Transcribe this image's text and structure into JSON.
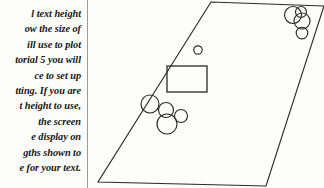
{
  "page": {
    "background_color": "#fdfdfc",
    "ink_color": "#2a2a2a",
    "width": 324,
    "height": 188
  },
  "text_column": {
    "style": "italic",
    "alignment": "right",
    "clipped_at_left_edge": true,
    "lines": [
      "l text height",
      "ow the size of",
      "ill use to plot",
      "torial 5 you will",
      "ce to set up",
      "tting. If you are",
      "t height to use,",
      "the screen",
      "e display on",
      "gths shown to",
      "e for your text."
    ]
  },
  "divider": {
    "orientation": "vertical",
    "color": "#9a9a9a",
    "x": 87
  },
  "diagram": {
    "caption": "",
    "outline": {
      "name": "parallelogram-outline",
      "points": "123,2 236,6 178,186 10,182"
    },
    "rectangle": {
      "name": "inner-rectangle",
      "x": 79,
      "y": 66,
      "width": 40,
      "height": 26
    },
    "small_circle": {
      "name": "lone-small-circle",
      "cx": 110,
      "cy": 50,
      "r": 4.2
    },
    "cluster_top_right": {
      "name": "circle-cluster-top-right",
      "circles": [
        {
          "cx": 205,
          "cy": 15,
          "r": 8.5
        },
        {
          "cx": 213,
          "cy": 12,
          "r": 5.5
        },
        {
          "cx": 214,
          "cy": 21,
          "r": 8.0
        },
        {
          "cx": 214,
          "cy": 33,
          "r": 5.8
        }
      ]
    },
    "cluster_bottom_left": {
      "name": "circle-cluster-bottom-left",
      "circles": [
        {
          "cx": 62,
          "cy": 104,
          "r": 9.0
        },
        {
          "cx": 78,
          "cy": 110,
          "r": 7.5
        },
        {
          "cx": 93,
          "cy": 116,
          "r": 6.5
        },
        {
          "cx": 79,
          "cy": 124,
          "r": 10.0
        }
      ]
    }
  }
}
